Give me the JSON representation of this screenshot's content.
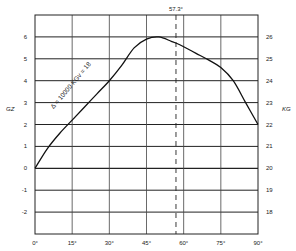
{
  "chart_data": {
    "type": "line",
    "title": "",
    "xlabel": "",
    "ylabel": "GZ",
    "ylabel_right": "KG",
    "xlim": [
      0,
      90
    ],
    "ylim": [
      -3,
      7
    ],
    "ylim_right": [
      17,
      27
    ],
    "x_ticks": [
      "0°",
      "15°",
      "30°",
      "45°",
      "60°",
      "75°",
      "90°"
    ],
    "x_tick_values": [
      0,
      15,
      30,
      45,
      60,
      75,
      90
    ],
    "y_ticks": [
      "6",
      "5",
      "4",
      "3",
      "2",
      "1",
      "0",
      "-1",
      "-2"
    ],
    "y_tick_values": [
      6,
      5,
      4,
      3,
      2,
      1,
      0,
      -1,
      -2
    ],
    "y_ticks_right": [
      "26",
      "25",
      "24",
      "23",
      "22",
      "21",
      "20",
      "19",
      "18"
    ],
    "grid": true,
    "legend": null,
    "series": [
      {
        "name": "Δ = 10000 KGv = 18",
        "x": [
          0,
          5,
          10,
          15,
          20,
          25,
          30,
          35,
          40,
          45,
          50,
          55,
          57.3,
          60,
          65,
          70,
          75,
          80,
          85,
          90
        ],
        "values": [
          0,
          0.9,
          1.6,
          2.2,
          2.8,
          3.4,
          4.0,
          4.7,
          5.5,
          5.9,
          6.0,
          5.8,
          5.7,
          5.55,
          5.25,
          4.95,
          4.6,
          4.0,
          3.0,
          2.0
        ]
      }
    ],
    "annotations": [
      {
        "text": "Δ = 10000 KGv = 18",
        "type": "curve-label",
        "rotation_deg": -50
      },
      {
        "text": "57.3°",
        "type": "vertical-dashed-line",
        "x": 57.3
      }
    ]
  }
}
